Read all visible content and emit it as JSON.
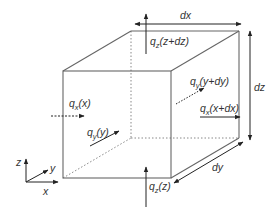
{
  "diagram": {
    "colors": {
      "line": "#555555",
      "dotted": "#888888",
      "text": "#333333",
      "background": "#ffffff"
    },
    "labels": {
      "dx": "dx",
      "dy": "dy",
      "dz": "dz",
      "qz_top_q": "q",
      "qz_top_sub": "z",
      "qz_top_arg": "(z+dz)",
      "qz_bottom_q": "q",
      "qz_bottom_sub": "z",
      "qz_bottom_arg": "(z)",
      "qx_left_q": "q",
      "qx_left_sub": "x",
      "qx_left_arg": "(x)",
      "qx_right_q": "q",
      "qx_right_sub": "x",
      "qx_right_arg": "(x+dx)",
      "qy_front_q": "q",
      "qy_front_sub": "y",
      "qy_front_arg": "(y)",
      "qy_back_q": "q",
      "qy_back_sub": "y",
      "qy_back_arg": "(y+dy)"
    },
    "axes": {
      "x": "x",
      "y": "y",
      "z": "z"
    }
  }
}
